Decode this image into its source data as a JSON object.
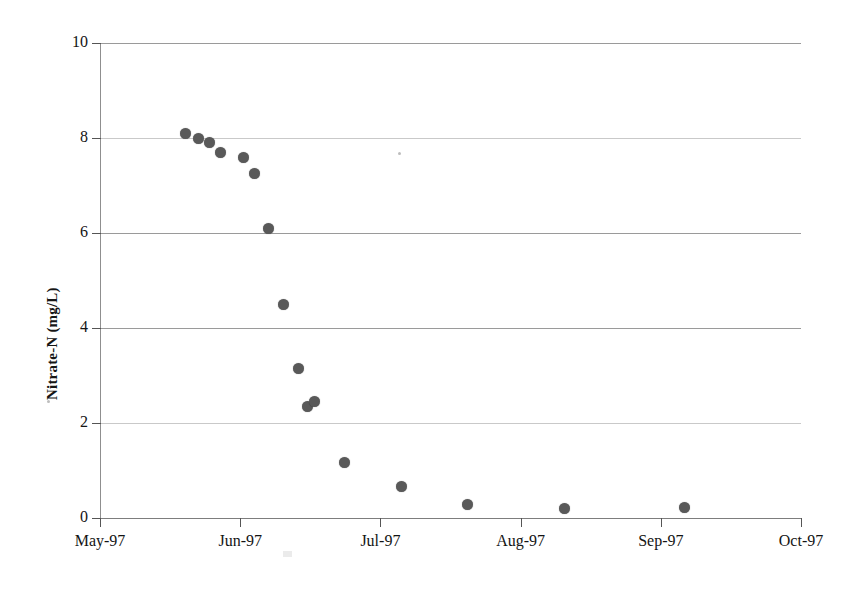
{
  "chart_data": {
    "type": "scatter",
    "title": "",
    "subtitle": "",
    "xlabel": "",
    "ylabel": "Nitrate-N (mg/L)",
    "ylim": [
      0,
      10
    ],
    "ytick_values": [
      0,
      2,
      4,
      6,
      8,
      10
    ],
    "ytick_labels": [
      "0",
      "2",
      "4",
      "6",
      "8",
      "10"
    ],
    "xtick_labels": [
      "May-97",
      "Jun-97",
      "Jul-97",
      "Aug-97",
      "Sep-97",
      "Oct-97"
    ],
    "xtick_fractions": [
      0.0,
      0.2,
      0.4,
      0.6,
      0.8,
      1.0
    ],
    "grid": true,
    "grid_axis": "y",
    "legend": "none",
    "marker": "filled-circle",
    "marker_color": "#595959",
    "series": [
      {
        "name": "Nitrate-N",
        "points": [
          {
            "x_fraction": 0.1226,
            "x_label": "late May-97",
            "y": 8.1
          },
          {
            "x_fraction": 0.1412,
            "x_label": "late May-97",
            "y": 8.0
          },
          {
            "x_fraction": 0.1569,
            "x_label": "late May-97",
            "y": 7.9
          },
          {
            "x_fraction": 0.1712,
            "x_label": "late May-97",
            "y": 7.7
          },
          {
            "x_fraction": 0.2054,
            "x_label": "early Jun-97",
            "y": 7.6
          },
          {
            "x_fraction": 0.2211,
            "x_label": "early Jun-97",
            "y": 7.25
          },
          {
            "x_fraction": 0.2397,
            "x_label": "early Jun-97",
            "y": 6.1
          },
          {
            "x_fraction": 0.2611,
            "x_label": "mid Jun-97",
            "y": 4.5
          },
          {
            "x_fraction": 0.2825,
            "x_label": "mid Jun-97",
            "y": 3.15
          },
          {
            "x_fraction": 0.2953,
            "x_label": "late Jun-97",
            "y": 2.35
          },
          {
            "x_fraction": 0.3067,
            "x_label": "late Jun-97",
            "y": 2.45
          },
          {
            "x_fraction": 0.3495,
            "x_label": "late Jun-97",
            "y": 1.17
          },
          {
            "x_fraction": 0.4307,
            "x_label": "early Jul-97",
            "y": 0.67
          },
          {
            "x_fraction": 0.5248,
            "x_label": "mid Jul-97",
            "y": 0.28
          },
          {
            "x_fraction": 0.6632,
            "x_label": "mid Aug-97",
            "y": 0.2
          },
          {
            "x_fraction": 0.8345,
            "x_label": "early Sep-97",
            "y": 0.22
          }
        ]
      }
    ]
  }
}
